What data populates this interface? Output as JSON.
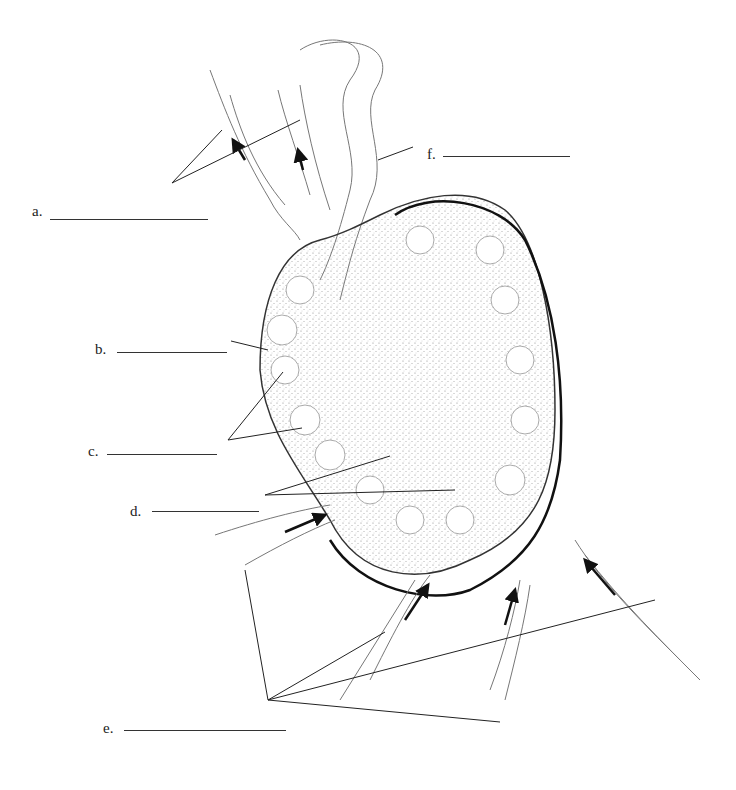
{
  "diagram": {
    "labels": [
      {
        "key": "a",
        "text": "a.",
        "x": 32,
        "y": 210,
        "blank_x": 50,
        "blank_w": 158
      },
      {
        "key": "b",
        "text": "b.",
        "x": 95,
        "y": 345,
        "blank_x": 117,
        "blank_w": 110
      },
      {
        "key": "c",
        "text": "c.",
        "x": 88,
        "y": 448,
        "blank_x": 107,
        "blank_w": 110
      },
      {
        "key": "d",
        "text": "d.",
        "x": 130,
        "y": 478,
        "blank_x": 152,
        "blank_w": 107
      },
      {
        "key": "e",
        "text": "e.",
        "x": 103,
        "y": 727,
        "blank_x": 124,
        "blank_w": 162
      },
      {
        "key": "f",
        "text": "f.",
        "x": 427,
        "y": 150,
        "blank_x": 443,
        "blank_w": 127
      }
    ]
  }
}
